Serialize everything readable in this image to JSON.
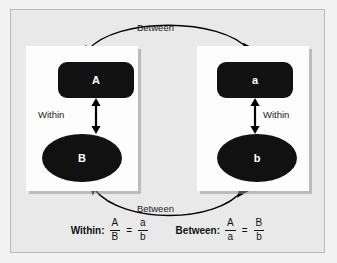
{
  "diagram": {
    "background_color": "#e9e9e9",
    "node_color": "#111111",
    "node_text_color": "#ffffff",
    "panel_color": "#fdfdfd"
  },
  "panels": [
    {
      "id": "left",
      "rect_label": "A",
      "ellipse_label": "B",
      "within_label": "Within"
    },
    {
      "id": "right",
      "rect_label": "a",
      "ellipse_label": "b",
      "within_label": "Within"
    }
  ],
  "arcs": {
    "top_label": "Between",
    "bottom_label": "Between"
  },
  "formulas": [
    {
      "title": "Within:",
      "left_numerator": "A",
      "left_denominator": "B",
      "equals": "=",
      "right_numerator": "a",
      "right_denominator": "b"
    },
    {
      "title": "Between:",
      "left_numerator": "A",
      "left_denominator": "a",
      "equals": "=",
      "right_numerator": "B",
      "right_denominator": "b"
    }
  ]
}
